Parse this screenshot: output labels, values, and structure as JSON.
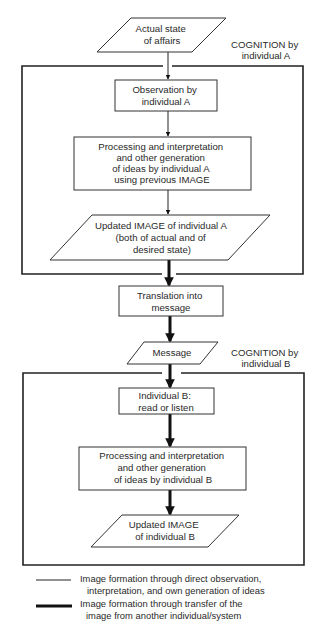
{
  "diagram": {
    "nodes": {
      "actual_state": {
        "shape": "parallelogram",
        "lines": [
          "Actual state",
          "of affairs"
        ]
      },
      "observation_a": {
        "shape": "rectangle",
        "lines": [
          "Observation by",
          "individual A"
        ]
      },
      "processing_a": {
        "shape": "rectangle",
        "lines": [
          "Processing and interpretation",
          "and other generation",
          "of ideas by individual A",
          "using previous IMAGE"
        ]
      },
      "updated_image_a": {
        "shape": "parallelogram",
        "lines": [
          "Updated IMAGE of individual A",
          "(both of actual and of",
          "desired state)"
        ]
      },
      "translation": {
        "shape": "rectangle",
        "lines": [
          "Translation into",
          "message"
        ]
      },
      "message": {
        "shape": "parallelogram",
        "lines": [
          "Message"
        ]
      },
      "individual_b_read": {
        "shape": "rectangle",
        "lines": [
          "Individual B:",
          "read or listen"
        ]
      },
      "processing_b": {
        "shape": "rectangle",
        "lines": [
          "Processing and interpretation",
          "and other generation",
          "of  ideas by individual B"
        ]
      },
      "updated_image_b": {
        "shape": "parallelogram",
        "lines": [
          "Updated IMAGE",
          "of individual B"
        ]
      }
    },
    "groups": {
      "cognition_a": {
        "lines": [
          "COGNITION by",
          "individual A"
        ]
      },
      "cognition_b": {
        "lines": [
          "COGNITION  by",
          "individual B"
        ]
      }
    },
    "edges": [
      {
        "from": "actual_state",
        "to": "observation_a",
        "style": "thin"
      },
      {
        "from": "observation_a",
        "to": "processing_a",
        "style": "thin"
      },
      {
        "from": "processing_a",
        "to": "updated_image_a",
        "style": "thin"
      },
      {
        "from": "updated_image_a",
        "to": "translation",
        "style": "thick"
      },
      {
        "from": "translation",
        "to": "message",
        "style": "thick"
      },
      {
        "from": "message",
        "to": "individual_b_read",
        "style": "thick"
      },
      {
        "from": "individual_b_read",
        "to": "processing_b",
        "style": "thick"
      },
      {
        "from": "processing_b",
        "to": "updated_image_b",
        "style": "thick"
      }
    ],
    "legend": {
      "thin": {
        "lines": [
          "Image formation through direct observation,",
          "interpretation, and own generation of ideas"
        ]
      },
      "thick": {
        "lines": [
          "Image formation through transfer of the",
          "image from another individual/system"
        ]
      }
    }
  }
}
